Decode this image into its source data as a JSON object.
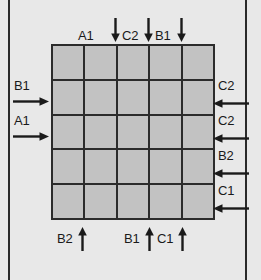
{
  "figure": {
    "kind": "grid-flow-diagram",
    "grid": {
      "rows": 5,
      "columns": 5,
      "cell_fill": "#c2c2c2",
      "line_color": "#2b2b2b"
    },
    "background_color": "#e8e8e8",
    "frame_color": "#2a2a2a"
  },
  "top_arrows": [
    {
      "label": "A1",
      "direction": "down",
      "column": 2
    },
    {
      "label": "C2",
      "direction": "down",
      "column": 3
    },
    {
      "label": "B1",
      "direction": "down",
      "column": 4
    }
  ],
  "left_arrows": [
    {
      "label": "B1",
      "direction": "right",
      "row": 2
    },
    {
      "label": "A1",
      "direction": "right",
      "row": 3
    }
  ],
  "right_arrows": [
    {
      "label": "C2",
      "direction": "left",
      "row": 2
    },
    {
      "label": "C2",
      "direction": "left",
      "row": 3
    },
    {
      "label": "B2",
      "direction": "left",
      "row": 4
    },
    {
      "label": "C1",
      "direction": "left",
      "row": 5
    }
  ],
  "bottom_arrows": [
    {
      "label": "B2",
      "direction": "up",
      "column": 1
    },
    {
      "label": "B1",
      "direction": "up",
      "column": 3
    },
    {
      "label": "C1",
      "direction": "up",
      "column": 4
    }
  ]
}
